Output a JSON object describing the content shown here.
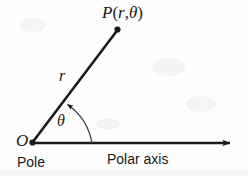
{
  "figure": {
    "type": "polar-coordinate-diagram",
    "width": 248,
    "height": 176,
    "background_color": "#fefefe",
    "ink_color": "#1a1a1a"
  },
  "labels": {
    "point_p_prefix": "P",
    "point_p_open": "(",
    "point_p_r": "r",
    "point_p_comma": ",",
    "point_p_theta": "θ",
    "point_p_close": ")",
    "radius": "r",
    "angle": "θ",
    "origin": "O",
    "pole": "Pole",
    "polar_axis": "Polar axis"
  },
  "geometry": {
    "origin": {
      "x": 32,
      "y": 143
    },
    "point_p": {
      "x": 117,
      "y": 29
    },
    "axis_end": {
      "x": 237,
      "y": 143
    },
    "arc_radius": 60,
    "arc_start_angle_deg": 0,
    "arc_end_angle_deg": 53,
    "ray_angle_deg": 53,
    "ray_length": 142
  },
  "icons": {
    "axis_arrowhead": "arrow-right-icon",
    "arc_arrowhead": "arc-arrow-icon",
    "point_marker": "filled-dot-icon"
  }
}
